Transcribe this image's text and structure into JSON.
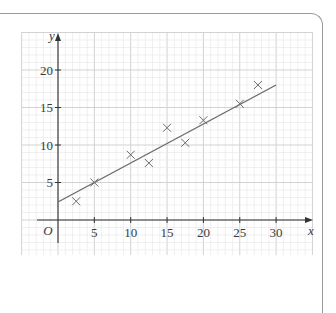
{
  "chart_data": {
    "type": "scatter",
    "title": "",
    "xlabel": "x",
    "ylabel": "y",
    "origin_label": "O",
    "xlim": [
      -5,
      35
    ],
    "ylim": [
      -4.7,
      25
    ],
    "x_ticks": [
      5,
      10,
      15,
      20,
      25,
      30
    ],
    "y_ticks": [
      5,
      10,
      15,
      20
    ],
    "grid": true,
    "grid_minor_step": 1,
    "grid_major_step": 5,
    "marker": "x",
    "points": [
      {
        "x": 2.5,
        "y": 2.5
      },
      {
        "x": 5,
        "y": 5
      },
      {
        "x": 10,
        "y": 8.7
      },
      {
        "x": 12.5,
        "y": 7.6
      },
      {
        "x": 15,
        "y": 12.3
      },
      {
        "x": 17.5,
        "y": 10.3
      },
      {
        "x": 20,
        "y": 13.3
      },
      {
        "x": 25,
        "y": 15.5
      },
      {
        "x": 27.5,
        "y": 18
      }
    ],
    "line_of_best_fit": {
      "x1": 0,
      "y1": 2.4,
      "x2": 30,
      "y2": 18
    },
    "colors": {
      "grid_minor": "#e6e6e6",
      "grid_major": "#d2d2d2",
      "axis": "#333333",
      "line": "#6b6b6b",
      "marker": "#6b6b6b",
      "frame": "#9a9a9a"
    }
  }
}
